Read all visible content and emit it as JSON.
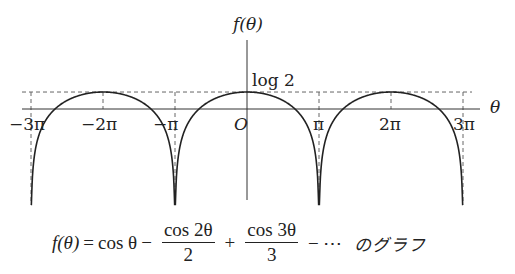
{
  "chart_data": {
    "type": "line",
    "function": "f(θ) = log(2|cos(θ/2)|)",
    "xlabel": "θ",
    "ylabel": "f(θ)",
    "xlim_pi": [
      -3.2,
      3.2
    ],
    "ylim": [
      -3.9,
      1.5
    ],
    "grid": false,
    "legend": null,
    "x_ticks": [
      {
        "value_pi": -3,
        "label": "−3π"
      },
      {
        "value_pi": -2,
        "label": "−2π"
      },
      {
        "value_pi": -1,
        "label": "−π"
      },
      {
        "value_pi": 0,
        "label": "O"
      },
      {
        "value_pi": 1,
        "label": "π"
      },
      {
        "value_pi": 2,
        "label": "2π"
      },
      {
        "value_pi": 3,
        "label": "3π"
      }
    ],
    "y_annotations": [
      {
        "value": 0.693,
        "label": "log 2",
        "style": "dashed"
      }
    ],
    "vertical_asymptotes_pi": [
      -3,
      -1,
      1,
      3
    ],
    "maxima": [
      {
        "x_pi": -2,
        "y": 0.693
      },
      {
        "x_pi": 0,
        "y": 0.693
      },
      {
        "x_pi": 2,
        "y": 0.693
      }
    ],
    "branches_pi": [
      [
        -3,
        -1
      ],
      [
        -1,
        1
      ],
      [
        1,
        3
      ]
    ]
  },
  "axes": {
    "x_label": "θ",
    "y_label": "f(θ)",
    "origin_label": "O",
    "log2_label": "log 2"
  },
  "caption": {
    "lhs": "f(θ)",
    "eq": "=",
    "term1": "cos θ",
    "minus1": "−",
    "frac1_num": "cos 2θ",
    "frac1_den": "2",
    "plus": "+",
    "frac2_num": "cos 3θ",
    "frac2_den": "3",
    "minus2": "− ⋯",
    "suffix": "のグラフ"
  }
}
